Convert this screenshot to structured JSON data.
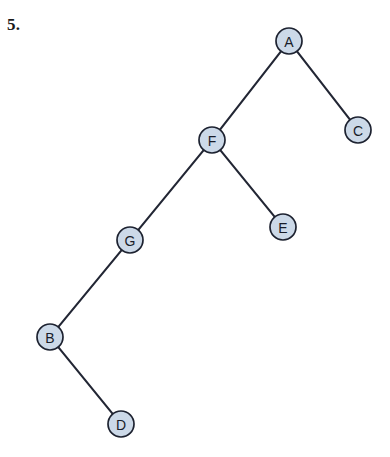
{
  "page": {
    "problem_number": "5.",
    "background_color": "#ffffff"
  },
  "diagram": {
    "type": "binary-tree",
    "node_fill_color": "#ccd9e8",
    "node_stroke_color": "#1d2230",
    "edge_color": "#222634",
    "label_color": "#181c28",
    "node_radius": 13,
    "nodes": [
      {
        "id": "A",
        "label": "A",
        "cx": 289,
        "cy": 41
      },
      {
        "id": "C",
        "label": "C",
        "cx": 358,
        "cy": 130
      },
      {
        "id": "F",
        "label": "F",
        "cx": 212,
        "cy": 140
      },
      {
        "id": "E",
        "label": "E",
        "cx": 283,
        "cy": 227
      },
      {
        "id": "G",
        "label": "G",
        "cx": 130,
        "cy": 240
      },
      {
        "id": "B",
        "label": "B",
        "cx": 50,
        "cy": 337
      },
      {
        "id": "D",
        "label": "D",
        "cx": 121,
        "cy": 424
      }
    ],
    "edges": [
      {
        "from": "A",
        "to": "F"
      },
      {
        "from": "A",
        "to": "C"
      },
      {
        "from": "F",
        "to": "G"
      },
      {
        "from": "F",
        "to": "E"
      },
      {
        "from": "G",
        "to": "B"
      },
      {
        "from": "B",
        "to": "D"
      }
    ]
  }
}
